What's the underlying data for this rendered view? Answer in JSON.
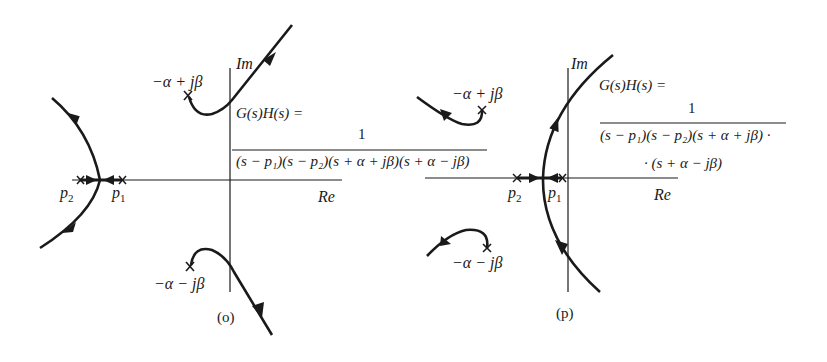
{
  "figure": {
    "panels": [
      {
        "id": "o",
        "caption": "(o)",
        "axes": {
          "real_label": "Re",
          "imag_label": "Im"
        },
        "poles": {
          "p1": "p1",
          "p2": "p2",
          "upper_complex": "−α + jβ",
          "lower_complex": "−α − jβ"
        },
        "transfer_function": {
          "lhs": "G(s)H(s) =",
          "numerator": "1",
          "denominator": "(s − p1)(s − p2)(s + α + jβ)(s + α − jβ)"
        }
      },
      {
        "id": "p",
        "caption": "(p)",
        "axes": {
          "real_label": "Re",
          "imag_label": "Im"
        },
        "poles": {
          "p1": "p1",
          "p2": "p2",
          "upper_complex": "−α + jβ",
          "lower_complex": "−α − jβ"
        },
        "transfer_function": {
          "lhs": "G(s)H(s) =",
          "numerator": "1",
          "denominator_line1": "(s − p1)(s − p2)(s + α + jβ) ·",
          "denominator_line2": "· (s + α − jβ)"
        }
      }
    ],
    "colors": {
      "ink": "#1a1a1a",
      "background": "#ffffff"
    }
  },
  "labels": {
    "o_im": "Im",
    "o_re": "Re",
    "o_p1": "p",
    "o_p1_sub": "1",
    "o_p2": "p",
    "o_p2_sub": "2",
    "o_upper": "−α + jβ",
    "o_lower": "−α − jβ",
    "o_lhs": "G(s)H(s) =",
    "o_num": "1",
    "o_den": "(s − p₁)(s − p₂)(s + α + jβ)(s + α − jβ)",
    "o_caption": "(o)",
    "p_im": "Im",
    "p_re": "Re",
    "p_p1": "p",
    "p_p1_sub": "1",
    "p_p2": "p",
    "p_p2_sub": "2",
    "p_upper": "−α + jβ",
    "p_lower": "−α − jβ",
    "p_lhs": "G(s)H(s) =",
    "p_num": "1",
    "p_den1": "(s − p₁)(s − p₂)(s + α + jβ) ·",
    "p_den2": "· (s + α − jβ)",
    "p_caption": "(p)"
  }
}
